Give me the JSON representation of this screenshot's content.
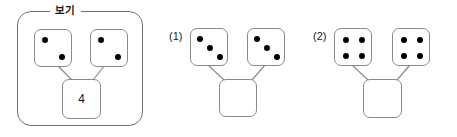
{
  "example": {
    "legend_label": "보기",
    "dice": [
      {
        "name": "example-die-left",
        "pip_count": 2,
        "pattern": "diagonal-2"
      },
      {
        "name": "example-die-right",
        "pip_count": 2,
        "pattern": "diagonal-2"
      }
    ],
    "result": {
      "value": "4",
      "filled": true
    }
  },
  "problems": [
    {
      "label": "(1)",
      "dice": [
        {
          "name": "problem-1-die-left",
          "pip_count": 3,
          "pattern": "diagonal-3"
        },
        {
          "name": "problem-1-die-right",
          "pip_count": 3,
          "pattern": "diagonal-3"
        }
      ],
      "result": {
        "value": "",
        "filled": false
      }
    },
    {
      "label": "(2)",
      "dice": [
        {
          "name": "problem-2-die-left",
          "pip_count": 4,
          "pattern": "corners-4"
        },
        {
          "name": "problem-2-die-right",
          "pip_count": 4,
          "pattern": "corners-4"
        }
      ],
      "result": {
        "value": "",
        "filled": false
      }
    }
  ],
  "colors": {
    "pip": "#000000",
    "shape_outline": "#8a8a8a",
    "panel_outline": "#6f6f6f",
    "background": "#ffffff",
    "text": "#1a1a1a"
  }
}
